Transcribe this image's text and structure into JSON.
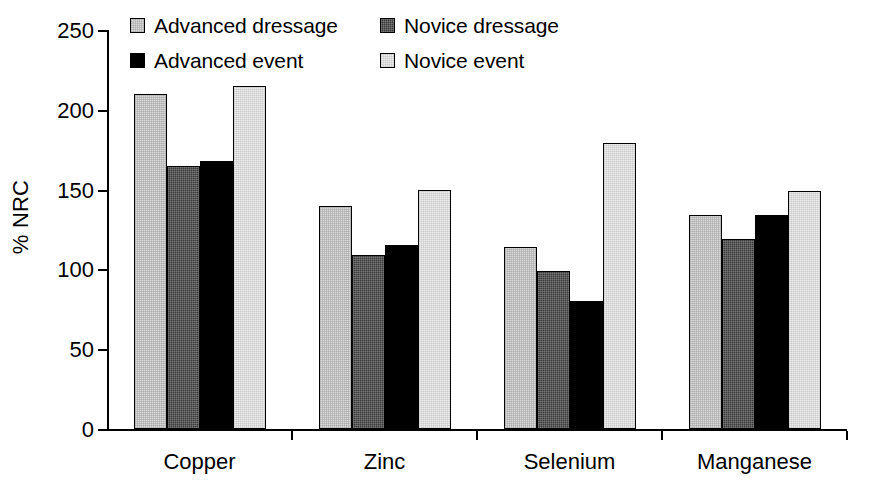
{
  "chart_data": {
    "type": "bar",
    "title": "",
    "xlabel": "",
    "ylabel": "% NRC",
    "ylim": [
      0,
      250
    ],
    "yticks": [
      0,
      50,
      100,
      150,
      200,
      250
    ],
    "grid": false,
    "legend_position": "top",
    "categories": [
      "Copper",
      "Zinc",
      "Selenium",
      "Manganese"
    ],
    "series": [
      {
        "name": "Advanced dressage",
        "color": "#d9d9d9",
        "values": [
          210,
          140,
          114,
          134
        ]
      },
      {
        "name": "Novice dressage",
        "color": "#3a3a3a",
        "values": [
          165,
          109,
          99,
          119
        ]
      },
      {
        "name": "Advanced event",
        "color": "#000000",
        "values": [
          168,
          115,
          80,
          134
        ]
      },
      {
        "name": "Novice event",
        "color": "#ededed",
        "values": [
          215,
          150,
          179,
          149
        ]
      }
    ]
  },
  "legend": {
    "entries": [
      {
        "label": "Advanced dressage",
        "swatch": "fill-s0"
      },
      {
        "label": "Novice dressage",
        "swatch": "fill-s1"
      },
      {
        "label": "Advanced event",
        "swatch": "fill-s2"
      },
      {
        "label": "Novice event",
        "swatch": "fill-s3"
      }
    ]
  },
  "axes": {
    "y_title": "% NRC",
    "y_tick_labels": [
      "250",
      "200",
      "150",
      "100",
      "50",
      "0"
    ],
    "x_tick_labels": [
      "Copper",
      "Zinc",
      "Selenium",
      "Manganese"
    ]
  }
}
